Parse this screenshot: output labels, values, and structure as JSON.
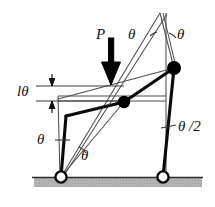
{
  "figure": {
    "name": "two-bar-linkage-buckling-diagram",
    "colors": {
      "line": "#111111",
      "thin_line": "#5a5a5a",
      "ground_fill": "#b8b8b8",
      "ground_line": "#333333",
      "joint_fill": "#000000",
      "pin_fill": "#ffffff",
      "background": "#ffffff"
    },
    "labels": {
      "load": "P",
      "theta_top_left": "θ",
      "theta_top_right": "θ",
      "theta_bottom_left": "θ",
      "theta_bottom_right": "θ",
      "displacement": "lθ",
      "half_theta": "θ /2"
    },
    "elements": {
      "load_arrow": "down-arrow-icon",
      "dimension_arrow": "double-arrow-icon",
      "left_pin": "pin-support-icon",
      "right_pin": "pin-support-icon",
      "middle_joint": "joint-icon",
      "top_joint": "joint-icon",
      "ground": "ground-hatch"
    }
  },
  "geometry": {
    "left_pin": [
      61,
      177
    ],
    "right_pin": [
      163,
      177
    ],
    "middle_joint": [
      124,
      102
    ],
    "top_joint": [
      174,
      68
    ],
    "apex": [
      160,
      13
    ],
    "ground_y": 177
  }
}
